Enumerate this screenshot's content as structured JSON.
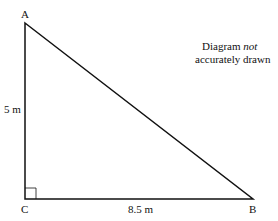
{
  "diagram": {
    "type": "right-triangle",
    "vertices": {
      "A": {
        "label": "A",
        "x": 25,
        "y": 23
      },
      "B": {
        "label": "B",
        "x": 253,
        "y": 199
      },
      "C": {
        "label": "C",
        "x": 25,
        "y": 199
      }
    },
    "right_angle_at": "C",
    "sides": {
      "AC": {
        "label": "5 m"
      },
      "CB": {
        "label": "8.5 m"
      }
    },
    "note": {
      "line1_prefix": "Diagram ",
      "line1_emphasis": "not",
      "line2": "accurately drawn"
    },
    "colors": {
      "stroke": "#111111",
      "background": "#ffffff"
    }
  }
}
